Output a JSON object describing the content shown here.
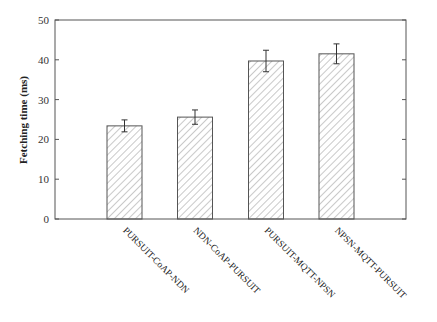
{
  "chart_data": {
    "type": "bar",
    "title": "",
    "xlabel": "",
    "ylabel": "Fetching time (ms)",
    "ylim": [
      0,
      50
    ],
    "yticks": [
      0,
      10,
      20,
      30,
      40,
      50
    ],
    "categories": [
      "PURSUIT-CoAP-NDN",
      "NDN-CoAP-PURSUIT",
      "PURSUIT-MQTT-NPSN",
      "NPSN-MQTT-PURSUIT"
    ],
    "values": [
      23.4,
      25.6,
      39.7,
      41.5
    ],
    "error": [
      1.5,
      1.8,
      2.7,
      2.5
    ],
    "grid": false,
    "legend": null,
    "bar_style": "diagonal hatch"
  },
  "axis": {
    "ylabel": "Fetching time (ms)",
    "ticks": [
      "0",
      "10",
      "20",
      "30",
      "40",
      "50"
    ]
  },
  "colors": {
    "axis": "#555555",
    "bar_edge": "#555555",
    "hatch": "#777777"
  }
}
